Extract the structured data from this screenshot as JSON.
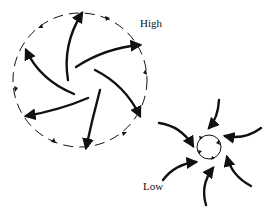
{
  "diagram": {
    "type": "pressure-system-circulation",
    "labels": {
      "high": "High",
      "low": "Low"
    },
    "high_system": {
      "description": "Dashed circle boundary with spiral outflow arrows radiating outward; small arrowheads on the dashed boundary indicate clockwise flow",
      "outflow_arrows": 6,
      "boundary": "dashed",
      "rotation": "clockwise"
    },
    "low_system": {
      "description": "Small solid circle with arrows converging inward, spiraling counterclockwise",
      "inflow_arrows": 7,
      "boundary": "solid",
      "rotation": "counterclockwise"
    },
    "colors": {
      "stroke": "#111111",
      "background": "#ffffff"
    }
  }
}
